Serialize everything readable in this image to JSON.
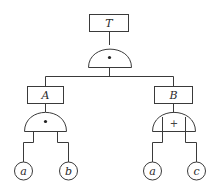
{
  "diagram": {
    "type": "fault-tree",
    "colors": {
      "line": "#3a3a3a",
      "text": "#2a2a2a",
      "background": "#ffffff"
    },
    "top_event": {
      "label": "T"
    },
    "top_gate": {
      "type": "AND",
      "symbol": "•"
    },
    "events": [
      {
        "id": "A",
        "label": "A",
        "gate": {
          "type": "AND",
          "symbol": "•"
        },
        "inputs": [
          {
            "label": "a"
          },
          {
            "label": "b"
          }
        ]
      },
      {
        "id": "B",
        "label": "B",
        "gate": {
          "type": "OR",
          "symbol": "+"
        },
        "inputs": [
          {
            "label": "a"
          },
          {
            "label": "c"
          }
        ]
      }
    ]
  }
}
